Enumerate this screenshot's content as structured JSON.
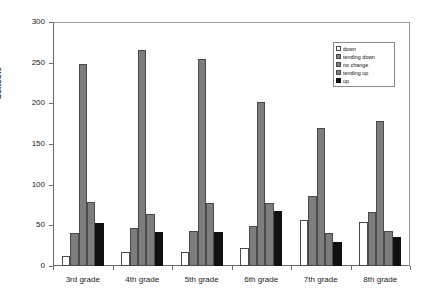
{
  "chart_data": {
    "type": "bar",
    "title": "",
    "xlabel": "",
    "ylabel": "Schools",
    "ylim": [
      0,
      300
    ],
    "yticks": [
      0,
      50,
      100,
      150,
      200,
      250,
      300
    ],
    "grid": false,
    "legend_position": "top-right",
    "categories": [
      "3rd grade",
      "4th grade",
      "5th grade",
      "6th grade",
      "7th grade",
      "8th grade"
    ],
    "series": [
      {
        "name": "down",
        "color": "#ffffff",
        "values": [
          12,
          17,
          17,
          22,
          57,
          54
        ]
      },
      {
        "name": "tending down",
        "color": "#7d7d7d",
        "values": [
          40,
          47,
          43,
          49,
          86,
          66
        ]
      },
      {
        "name": "no change",
        "color": "#7d7d7d",
        "values": [
          248,
          266,
          254,
          202,
          170,
          178
        ]
      },
      {
        "name": "tending up",
        "color": "#7d7d7d",
        "values": [
          79,
          64,
          77,
          77,
          41,
          43
        ]
      },
      {
        "name": "up",
        "color": "#111111",
        "values": [
          53,
          42,
          42,
          68,
          29,
          36
        ]
      }
    ]
  },
  "legend": {
    "items": [
      {
        "label": "down"
      },
      {
        "label": "tending down"
      },
      {
        "label": "no change"
      },
      {
        "label": "tending up"
      },
      {
        "label": "up"
      }
    ]
  }
}
